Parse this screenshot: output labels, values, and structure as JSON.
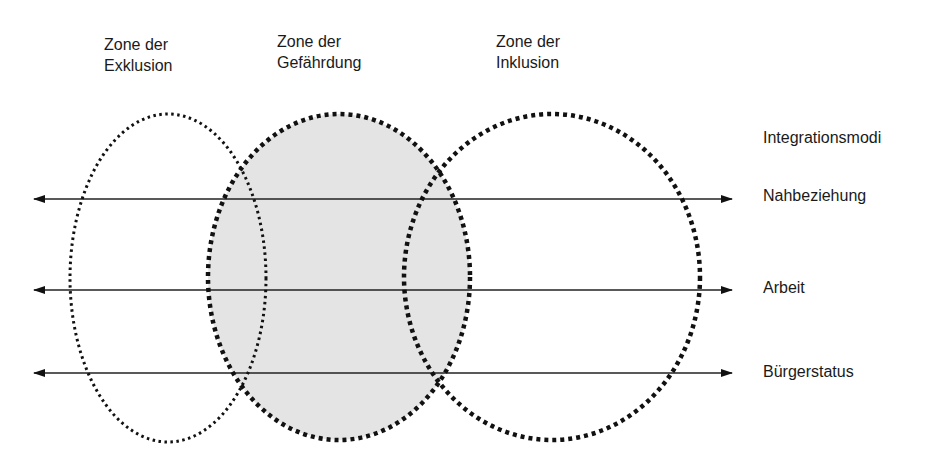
{
  "zones": [
    {
      "id": "exclusion",
      "line1": "Zone der",
      "line2": "Exklusion",
      "fill": "none",
      "style": "fine-dotted"
    },
    {
      "id": "endangerment",
      "line1": "Zone der",
      "line2": "Gefährdung",
      "fill": "#e4e4e4",
      "style": "heavy-dashed"
    },
    {
      "id": "inclusion",
      "line1": "Zone der",
      "line2": "Inklusion",
      "fill": "none",
      "style": "heavy-dashed"
    }
  ],
  "modes": {
    "header": "Integrationsmodi",
    "items": [
      {
        "label": "Nahbeziehung"
      },
      {
        "label": "Arbeit"
      },
      {
        "label": "Bürgerstatus"
      }
    ]
  },
  "colors": {
    "stroke": "#111111",
    "shade": "#e4e4e4",
    "text": "#1a1a1a"
  }
}
